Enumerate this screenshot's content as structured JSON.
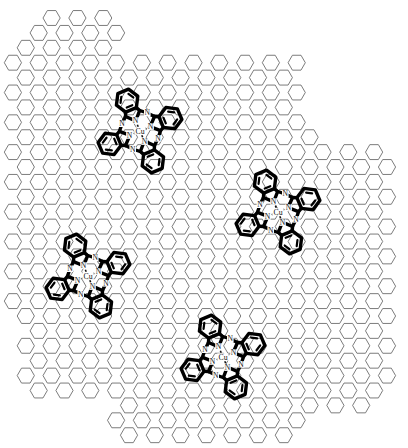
{
  "figure": {
    "caption": "",
    "width": 408,
    "height": 448,
    "background_color": "#ffffff"
  },
  "substrate": {
    "name": "graphene-honeycomb-lattice",
    "orientation": "flat-top-hexagon",
    "line_color": "#6d6d6d",
    "line_width": 0.9,
    "hex_circumradius": 8.6,
    "column_pitch": 25.8,
    "row_pitch": 14.9,
    "boundary": "irregular-stepped-flake-edge"
  },
  "molecule_template": {
    "name": "copper-phthalocyanine",
    "formula_label": "CuPc",
    "metal_label": "Cu",
    "inner_nitrogen_label": "N",
    "bridging_nitrogen_label": "N",
    "metal_color": "#111111",
    "bond_color": "#000000",
    "inner_nitrogen_count": 4,
    "bridging_nitrogen_count": 4,
    "benzene_ring_count": 4,
    "coordination_bond_style": "dashed",
    "coordination_bond_count": 4
  },
  "molecules": [
    {
      "id": "molecule-1",
      "label": "Cu",
      "center_x": 140,
      "center_y": 131,
      "rotation_deg": 22,
      "scale": 1.0
    },
    {
      "id": "molecule-2",
      "label": "Cu",
      "center_x": 88,
      "center_y": 276,
      "rotation_deg": 22,
      "scale": 1.0
    },
    {
      "id": "molecule-3",
      "label": "Cu",
      "center_x": 278,
      "center_y": 212,
      "rotation_deg": 22,
      "scale": 1.0
    },
    {
      "id": "molecule-4",
      "label": "Cu",
      "center_x": 223,
      "center_y": 357,
      "rotation_deg": 22,
      "scale": 1.0
    }
  ],
  "atom_labels": {
    "metal": "Cu",
    "nitrogen": "N"
  }
}
